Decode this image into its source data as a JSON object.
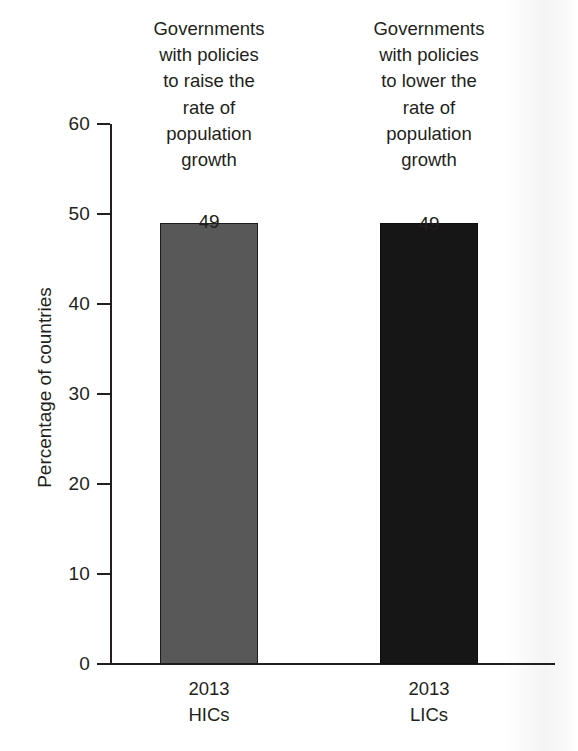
{
  "chart_data": {
    "type": "bar",
    "title": "",
    "subtitle": "",
    "xlabel": "",
    "ylabel": "Percentage of countries",
    "ylim": [
      0,
      60
    ],
    "yticks": [
      0,
      10,
      20,
      30,
      40,
      50,
      60
    ],
    "ytick_labels": [
      "0",
      "10",
      "20",
      "30",
      "40",
      "50",
      "60"
    ],
    "grid": false,
    "legend": "none",
    "categories": [
      "2013 HICs",
      "2013 LICs"
    ],
    "values": [
      49,
      49
    ],
    "data_labels": [
      "49",
      "49"
    ],
    "bar_colors": [
      "#585858",
      "#161616"
    ],
    "annotations": [
      "Governments with policies to raise the rate of population growth",
      "Governments with policies to lower the rate of population growth"
    ]
  },
  "axis": {
    "y_title": "Percentage of countries",
    "ticks": [
      {
        "value": 60,
        "label": "60",
        "top": 123
      },
      {
        "value": 50,
        "label": "50",
        "top": 213
      },
      {
        "value": 40,
        "label": "40",
        "top": 303
      },
      {
        "value": 30,
        "label": "30",
        "top": 393
      },
      {
        "value": 20,
        "label": "20",
        "top": 483
      },
      {
        "value": 10,
        "label": "10",
        "top": 573
      },
      {
        "value": 0,
        "label": "0",
        "top": 663
      }
    ]
  },
  "columns": [
    {
      "key": "hics",
      "header_line1": "Governments",
      "header_line2": "with policies",
      "header_line3": "to raise the",
      "header_line4": "rate of",
      "header_line5": "population",
      "header_line6": "growth",
      "value_label": "49",
      "cat_year": "2013",
      "cat_group": "HICs"
    },
    {
      "key": "lics",
      "header_line1": "Governments",
      "header_line2": "with policies",
      "header_line3": "to lower the",
      "header_line4": "rate of",
      "header_line5": "population",
      "header_line6": "growth",
      "value_label": "49",
      "cat_year": "2013",
      "cat_group": "LICs"
    }
  ]
}
